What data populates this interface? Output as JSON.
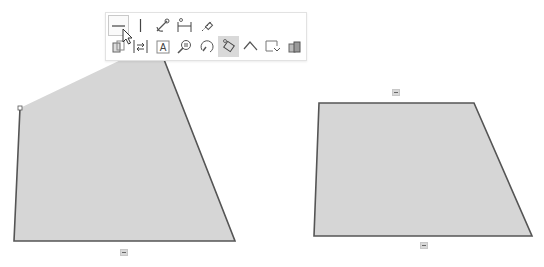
{
  "canvas": {
    "background": "#ffffff",
    "fill_color": "#d6d6d6",
    "stroke_color": "#555555",
    "shapes": [
      {
        "id": "left-sketch-profile",
        "points": "20,108 127,57 163,57 235,241 14,241",
        "selected_vertex": {
          "x": 20,
          "y": 108
        }
      },
      {
        "id": "right-sketch-profile",
        "points": "319,103 474,103 532,236 314,236"
      }
    ],
    "relations": [
      {
        "type": "horizontal",
        "icon": "horizontal-relation-icon",
        "x": 120,
        "y": 249
      },
      {
        "type": "horizontal",
        "icon": "horizontal-relation-icon",
        "x": 392,
        "y": 89
      },
      {
        "type": "horizontal",
        "icon": "horizontal-relation-icon",
        "x": 420,
        "y": 242
      }
    ]
  },
  "context_toolbar": {
    "row1": [
      {
        "icon": "horizontal-icon",
        "tooltip": "Horizontal",
        "state": "hover"
      },
      {
        "icon": "vertical-icon",
        "tooltip": "Vertical"
      },
      {
        "icon": "fix-icon",
        "tooltip": "Fix"
      },
      {
        "icon": "smart-dimension-icon",
        "tooltip": "Smart Dimension"
      },
      {
        "icon": "construction-geometry-icon",
        "tooltip": "Construction Geometry"
      }
    ],
    "row2": [
      {
        "icon": "convert-entities-icon",
        "tooltip": "Convert Entities"
      },
      {
        "icon": "offset-entities-icon",
        "tooltip": "Offset Entities"
      },
      {
        "icon": "sketch-text-icon",
        "tooltip": "Text"
      },
      {
        "icon": "zoom-selection-icon",
        "tooltip": "Zoom to Selection"
      },
      {
        "icon": "normal-to-icon",
        "tooltip": "Normal To"
      },
      {
        "icon": "select-chain-icon",
        "tooltip": "Select Chain",
        "state": "active"
      },
      {
        "icon": "trim-icon",
        "tooltip": "Trim"
      },
      {
        "icon": "exit-sketch-icon",
        "tooltip": "Exit Sketch"
      },
      {
        "icon": "appearance-icon",
        "tooltip": "Appearance"
      }
    ]
  }
}
